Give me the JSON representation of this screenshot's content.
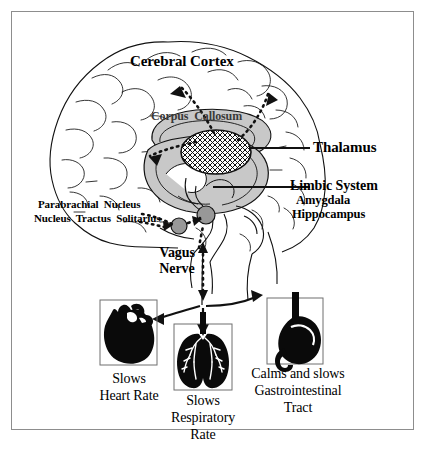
{
  "figure": {
    "border_color": "#8d8d8d",
    "background_color": "#ffffff",
    "ink_color": "#000000",
    "shade_color": "#c8c8c8",
    "node_color": "#989898"
  },
  "brain_labels": {
    "cerebral_cortex": "Cerebral Cortex",
    "corpus_callosum": "Corpus  Callosum",
    "thalamus": "Thalamus",
    "limbic_system": "Limbic System",
    "amygdala": "Amygdala",
    "hippocampus": "Hippocampus",
    "parabrachial_nucleus": "Parabrachial  Nucleus",
    "nucleus_tractus_solitarius": "Nucleus  Tractus  Solitarius",
    "vagus_nerve_line1": "Vagus",
    "vagus_nerve_line2": "Nerve"
  },
  "organs": [
    {
      "name": "heart",
      "icon": "heart-silhouette",
      "caption_line1": "Slows",
      "caption_line2": "Heart Rate"
    },
    {
      "name": "lungs",
      "icon": "lungs-silhouette",
      "caption_line1": "Slows",
      "caption_line2": "Respiratory",
      "caption_line3": "Rate"
    },
    {
      "name": "stomach",
      "icon": "stomach-silhouette",
      "caption_line1": "Calms and slows",
      "caption_line2": "Gastrointestinal",
      "caption_line3": "Tract"
    }
  ]
}
